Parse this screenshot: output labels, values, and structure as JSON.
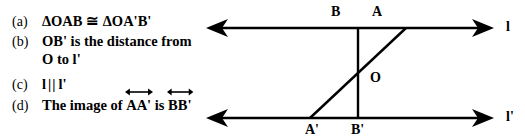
{
  "statements": [
    {
      "marker": "(a)",
      "text": "ΔOAB ≅ ΔOA'B'",
      "line2": ""
    },
    {
      "marker": "(b)",
      "text": "OB' is the distance from",
      "line2": "O to l'"
    },
    {
      "marker": "(c)",
      "text_pre": "l",
      "parallel_symbol": "||",
      "text_post": "l'",
      "line2": ""
    },
    {
      "marker": "(d)",
      "text_pre": "The image of",
      "vector1": "AA'",
      "text_mid": "is",
      "vector2": "BB'",
      "line2": ""
    }
  ],
  "diagram": {
    "line_top_label": "l",
    "line_bottom_label": "l'",
    "point_B": "B",
    "point_A": "A",
    "point_O": "O",
    "point_A_prime": "A'",
    "point_B_prime": "B'",
    "stroke_color": "#000000",
    "background_color": "#ffffff"
  }
}
